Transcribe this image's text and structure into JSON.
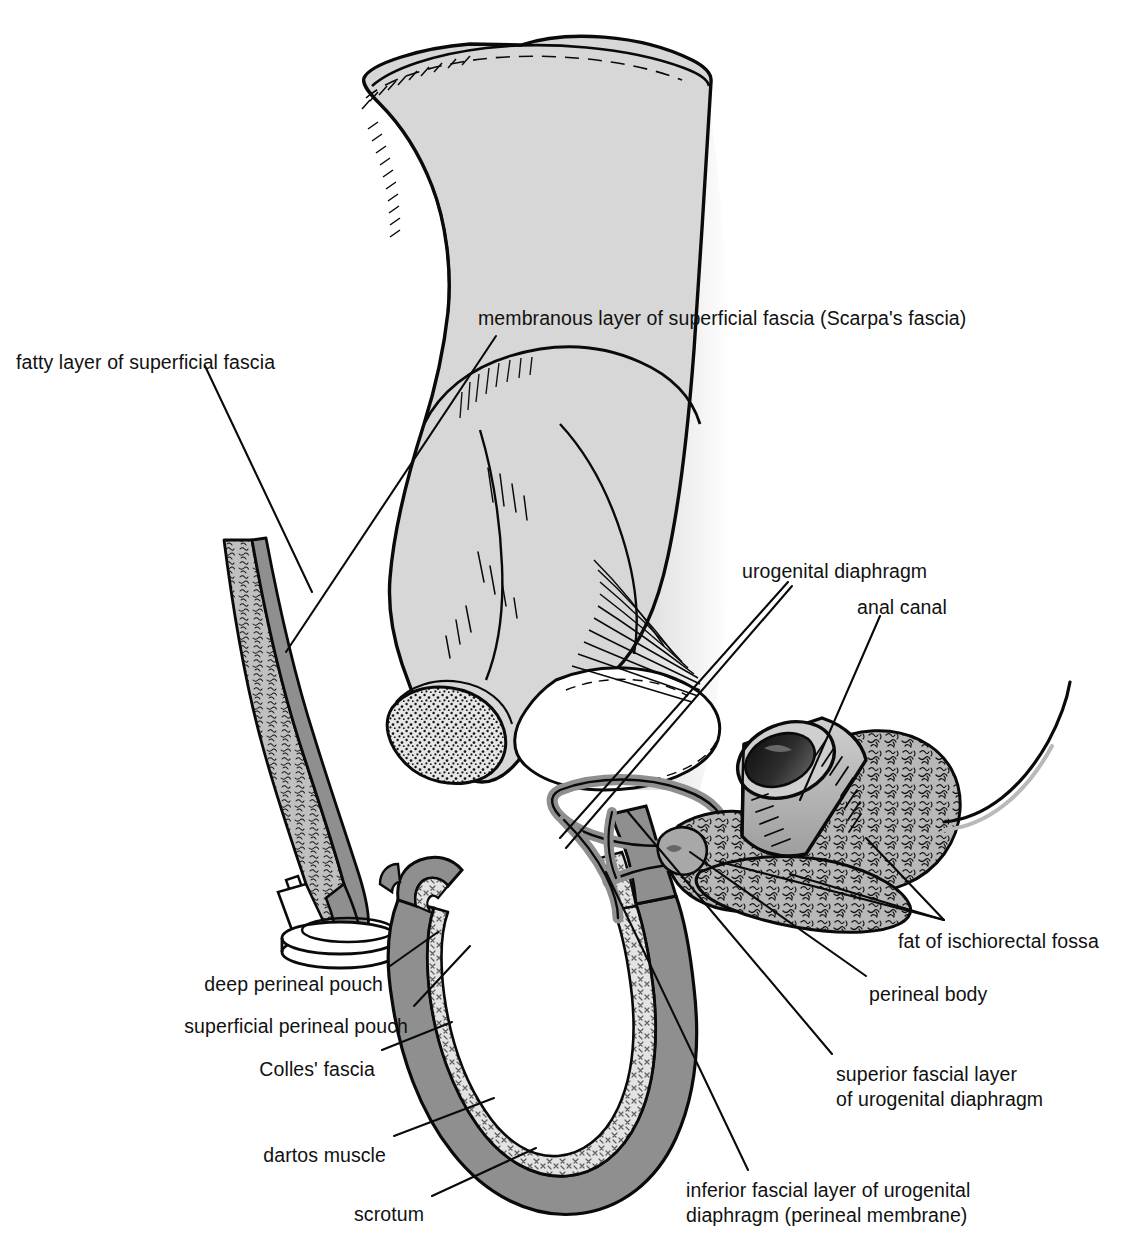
{
  "figure": {
    "signature": "VHC",
    "palette": {
      "background": "#ffffff",
      "ink": "#000000",
      "bone_fill": "#d7d7d7",
      "bone_shadow": "#c9c9c9",
      "fascia_band": "#8f8f8f",
      "fat_fill": "#b3b3b3",
      "fat_light": "#d0d0d0",
      "lumen_dark": "#1a1a1a",
      "leader_line": "#000000"
    }
  },
  "labels": [
    {
      "id": "fatty-layer",
      "text": "fatty layer of superficial fascia",
      "lines": [
        "fatty layer of superficial fascia"
      ],
      "x": 16,
      "y": 350,
      "align": "left"
    },
    {
      "id": "membranous-layer",
      "text": "membranous layer of superficial fascia (Scarpa's fascia)",
      "lines": [
        "membranous layer of superficial fascia (Scarpa's fascia)"
      ],
      "x": 478,
      "y": 306,
      "align": "left"
    },
    {
      "id": "urogenital-diaphragm",
      "text": "urogenital diaphragm",
      "lines": [
        "urogenital diaphragm"
      ],
      "x": 742,
      "y": 559,
      "align": "left"
    },
    {
      "id": "anal-canal",
      "text": "anal canal",
      "lines": [
        "anal canal"
      ],
      "x": 857,
      "y": 595,
      "align": "left"
    },
    {
      "id": "fat-ischiorectal-fossa",
      "text": "fat of ischiorectal fossa",
      "lines": [
        "fat of ischiorectal fossa"
      ],
      "x": 898,
      "y": 929,
      "align": "left"
    },
    {
      "id": "perineal-body",
      "text": "perineal body",
      "lines": [
        "perineal body"
      ],
      "x": 869,
      "y": 982,
      "align": "left"
    },
    {
      "id": "superior-fascial-layer",
      "text": "superior fascial layer of urogenital diaphragm",
      "lines": [
        "superior fascial layer",
        "of urogenital diaphragm"
      ],
      "x": 836,
      "y": 1062,
      "align": "left"
    },
    {
      "id": "inferior-fascial-layer",
      "text": "inferior fascial layer of urogenital diaphragm (perineal membrane)",
      "lines": [
        "inferior fascial layer of urogenital",
        "diaphragm (perineal membrane)"
      ],
      "x": 686,
      "y": 1178,
      "align": "left"
    },
    {
      "id": "deep-perineal-pouch",
      "text": "deep perineal pouch",
      "lines": [
        "deep perineal pouch"
      ],
      "x": 383,
      "y": 972,
      "align": "right"
    },
    {
      "id": "superficial-perineal-pouch",
      "text": "superficial perineal pouch",
      "lines": [
        "superficial perineal pouch"
      ],
      "x": 408,
      "y": 1014,
      "align": "right"
    },
    {
      "id": "colles-fascia",
      "text": "Colles' fascia",
      "lines": [
        "Colles' fascia"
      ],
      "x": 375,
      "y": 1057,
      "align": "right"
    },
    {
      "id": "dartos-muscle",
      "text": "dartos muscle",
      "lines": [
        "dartos muscle"
      ],
      "x": 386,
      "y": 1143,
      "align": "right"
    },
    {
      "id": "scrotum",
      "text": "scrotum",
      "lines": [
        "scrotum"
      ],
      "x": 424,
      "y": 1202,
      "align": "right"
    }
  ],
  "structures": [
    {
      "id": "hip-bone",
      "name": "hip bone (ilium, ischium and pubis)"
    },
    {
      "id": "obturator-foramen",
      "name": "obturator foramen"
    },
    {
      "id": "ischial-tuberosity",
      "name": "ischial tuberosity"
    },
    {
      "id": "abdominal-wall-flap",
      "name": "anterior abdominal wall layers"
    },
    {
      "id": "scrotal-wall",
      "name": "scrotal wall"
    },
    {
      "id": "anal-canal-cylinder",
      "name": "anal canal"
    },
    {
      "id": "ischiorectal-fat",
      "name": "fat of ischiorectal fossa"
    },
    {
      "id": "ug-diaphragm-bands",
      "name": "urogenital diaphragm fascial layers"
    },
    {
      "id": "perineal-body-node",
      "name": "perineal body"
    },
    {
      "id": "rectum-tail",
      "name": "rectum continuation"
    }
  ]
}
